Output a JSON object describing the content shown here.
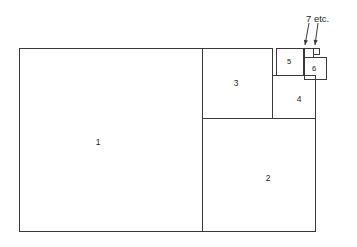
{
  "figure": {
    "kind": "fibonacci-square-tiling",
    "background_color": "#ffffff",
    "stroke_color": "#3a3a3a",
    "text_color": "#1d1d1d",
    "outer_rect": {
      "x": 19,
      "y": 48,
      "width": 307,
      "height": 183
    }
  },
  "annotation": {
    "text": "7 etc.",
    "x": 306,
    "y": 14
  },
  "squares": [
    {
      "label": "1",
      "x": 19,
      "y": 48,
      "size": 183,
      "label_x": 98,
      "label_y": 142
    },
    {
      "label": "2",
      "x": 202,
      "y": 118,
      "size": 113,
      "label_x": 268,
      "label_y": 178
    },
    {
      "label": "3",
      "x": 202,
      "y": 48,
      "size": 70,
      "label_x": 236,
      "label_y": 83
    },
    {
      "label": "4",
      "x": 272,
      "y": 75,
      "size": 43,
      "label_x": 299,
      "label_y": 99
    },
    {
      "label": "5",
      "x": 276,
      "y": 48,
      "size": 27,
      "label_x": 289,
      "label_y": 62
    },
    {
      "label": "6",
      "x": 304,
      "y": 57,
      "size": 22,
      "label_x": 314,
      "label_y": 69
    },
    {
      "label": "",
      "x": 304,
      "y": 48,
      "size": 9,
      "label_x": 0,
      "label_y": 0
    },
    {
      "label": "",
      "x": 313,
      "y": 48,
      "size": 6,
      "label_x": 0,
      "label_y": 0
    }
  ],
  "arrows": [
    {
      "x1": 309,
      "y1": 23,
      "x2": 305,
      "y2": 45
    },
    {
      "x1": 318,
      "y1": 23,
      "x2": 315,
      "y2": 45
    }
  ]
}
